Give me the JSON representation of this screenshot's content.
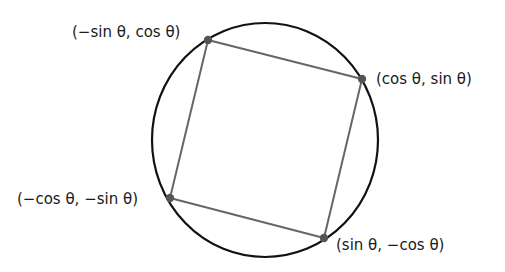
{
  "diagram": {
    "circle": {
      "cx": 265,
      "cy": 140,
      "rx": 113,
      "ry": 117,
      "stroke": "#111111",
      "stroke_width": 2.2
    },
    "square_stroke": "#666666",
    "point_fill": "#555555",
    "points": [
      {
        "id": "top",
        "x": 208,
        "y": 40,
        "label": "(−sin θ, cos θ)",
        "label_x": 72,
        "label_y": 37
      },
      {
        "id": "right",
        "x": 362,
        "y": 79,
        "label": "(cos θ, sin θ)",
        "label_x": 376,
        "label_y": 84
      },
      {
        "id": "bottom",
        "x": 324,
        "y": 238,
        "label": "(sin θ, −cos θ)",
        "label_x": 336,
        "label_y": 250
      },
      {
        "id": "left",
        "x": 170,
        "y": 198,
        "label": "(−cos θ, −sin θ)",
        "label_x": 17,
        "label_y": 204
      }
    ]
  }
}
